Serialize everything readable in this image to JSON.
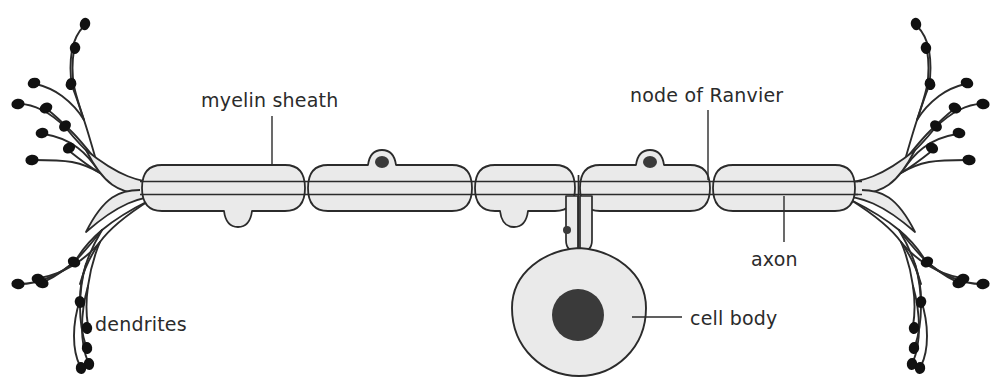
{
  "diagram": {
    "background_color": "#ffffff",
    "outline_color": "#2b2b2b",
    "cell_fill_color": "#eaeaea",
    "nucleus_color": "#3a3a3a",
    "dendrite_terminal_color": "#111111",
    "label_color": "#2b2b2b"
  },
  "labels": {
    "myelin_sheath": "myelin sheath",
    "node_of_ranvier": "node of Ranvier",
    "axon": "axon",
    "dendrites": "dendrites",
    "cell_body": "cell body"
  },
  "parts": {
    "myelin_segment_count": 5,
    "node_count": 4,
    "schwann_nuclei_visible": 2,
    "dendrite_trees": 2,
    "dendrite_terminals_per_side": 12,
    "nucleus_label": "nucleus"
  }
}
